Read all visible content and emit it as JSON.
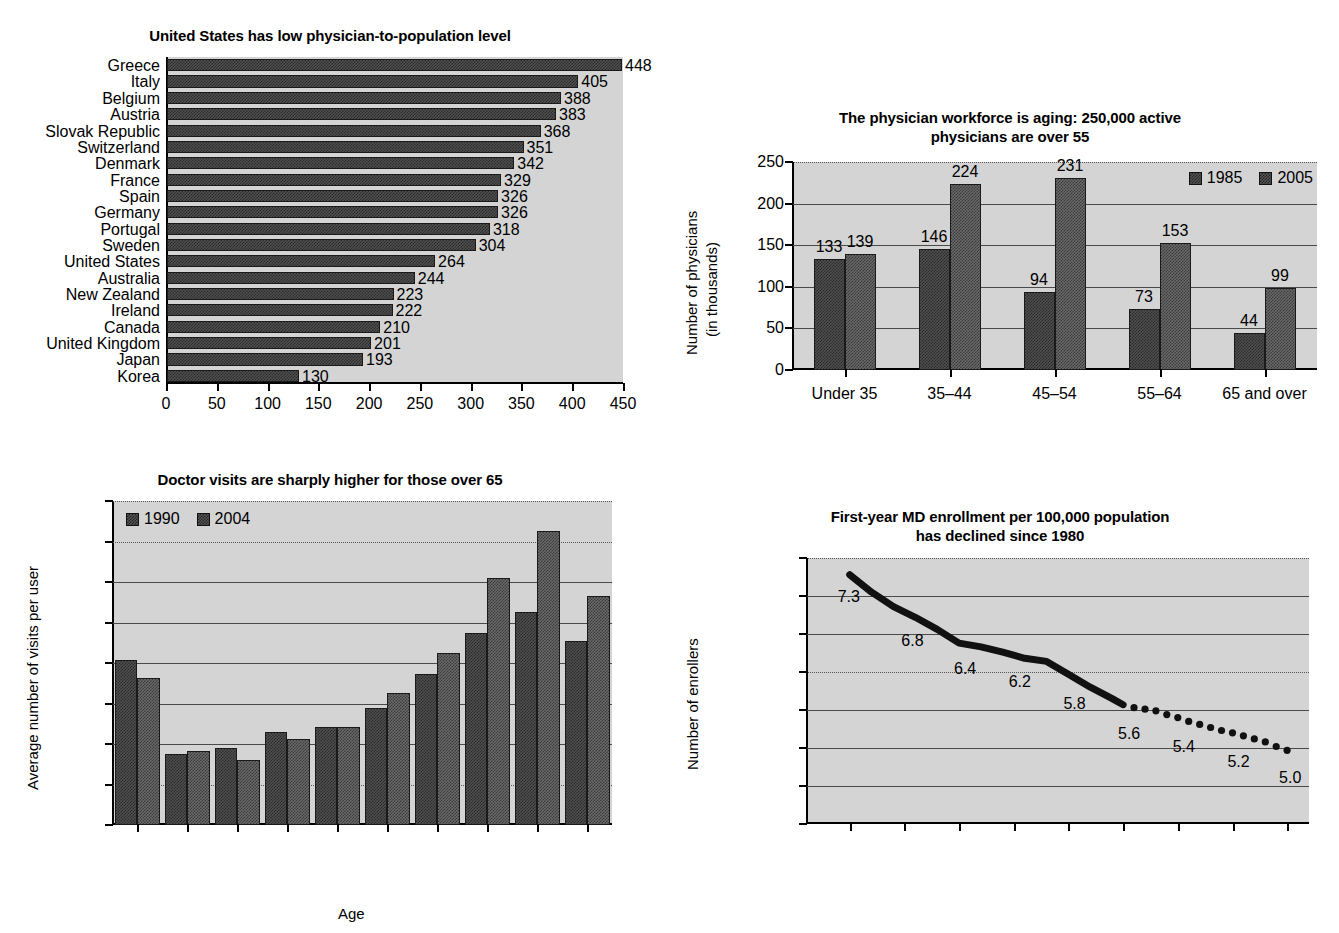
{
  "chart_data": [
    {
      "id": "physician-to-population",
      "type": "bar",
      "orientation": "horizontal",
      "title": "United States has low physician-to-population level",
      "xlabel": "",
      "ylabel": "",
      "xlim": [
        0,
        450
      ],
      "xticks": [
        0,
        50,
        100,
        150,
        200,
        250,
        300,
        350,
        400,
        450
      ],
      "grid": false,
      "legend": null,
      "categories": [
        "Greece",
        "Italy",
        "Belgium",
        "Austria",
        "Slovak Republic",
        "Switzerland",
        "Denmark",
        "France",
        "Spain",
        "Germany",
        "Portugal",
        "Sweden",
        "United States",
        "Australia",
        "New Zealand",
        "Ireland",
        "Canada",
        "United Kingdom",
        "Japan",
        "Korea"
      ],
      "values": [
        448,
        405,
        388,
        383,
        368,
        351,
        342,
        329,
        326,
        326,
        318,
        304,
        264,
        244,
        223,
        222,
        210,
        201,
        193,
        130
      ],
      "value_labels": [
        "448",
        "405",
        "388",
        "383",
        "368",
        "351",
        "342",
        "329",
        "326",
        "326",
        "318",
        "304",
        "264",
        "244",
        "223",
        "222",
        "210",
        "201",
        "193",
        "130"
      ]
    },
    {
      "id": "physician-workforce-aging",
      "type": "bar",
      "orientation": "vertical",
      "title_line1": "The physician workforce is aging: 250,000 active",
      "title_line2": "physicians are over 55",
      "title": "The physician workforce is aging: 250,000 active physicians are over 55",
      "ylabel_line1": "Number of physicians",
      "ylabel_line2": "(in thousands)",
      "xlabel": "",
      "ylim": [
        0,
        250
      ],
      "yticks": [
        0,
        50,
        100,
        150,
        200,
        250
      ],
      "ytick_labels": [
        "0",
        "50",
        "100",
        "150",
        "200",
        "250"
      ],
      "grid": true,
      "legend_position": "top-right",
      "categories": [
        "Under 35",
        "35–44",
        "45–54",
        "55–64",
        "65 and over"
      ],
      "series": [
        {
          "name": "1985",
          "values": [
            133,
            146,
            94,
            73,
            44
          ]
        },
        {
          "name": "2005",
          "values": [
            139,
            224,
            231,
            153,
            99
          ]
        }
      ]
    },
    {
      "id": "doctor-visits-by-age",
      "type": "bar",
      "orientation": "vertical",
      "title": "Doctor visits are sharply higher for those over 65",
      "ylabel": "Average number of visits per user",
      "xlabel": "Age",
      "ylim": [
        0.0,
        8.0
      ],
      "yticks": [
        0.0,
        1.0,
        2.0,
        3.0,
        4.0,
        5.0,
        6.0,
        7.0,
        8.0
      ],
      "ytick_labels": [
        "0.0",
        "1.0",
        "2.0",
        "3.0",
        "4.0",
        "5.0",
        "6.0",
        "7.0",
        "8.0"
      ],
      "grid": true,
      "legend_position": "top-left",
      "categories": [
        "<5",
        "5–14",
        "15–24",
        "25–34",
        "35–44",
        "45–54",
        "55–64",
        "65–74",
        "75–84",
        ">84"
      ],
      "series": [
        {
          "name": "1990",
          "values": [
            4.08,
            1.75,
            1.9,
            2.3,
            2.43,
            2.9,
            3.73,
            4.75,
            5.25,
            4.55
          ]
        },
        {
          "name": "2004",
          "values": [
            3.62,
            1.82,
            1.6,
            2.12,
            2.42,
            3.27,
            4.25,
            6.1,
            7.27,
            5.65
          ]
        }
      ]
    },
    {
      "id": "first-year-md-enrollment",
      "type": "line",
      "title_line1": "First-year MD enrollment per 100,000 population",
      "title_line2": "has declined since 1980",
      "title": "First-year MD enrollment per 100,000 population has declined since 1980",
      "ylabel": "Number of enrollers",
      "xlabel": "",
      "xlim": [
        1976,
        2022
      ],
      "ylim": [
        4.0,
        7.5
      ],
      "xticks": [
        1980,
        1985,
        1990,
        1995,
        2000,
        2005,
        2010,
        2015,
        2020
      ],
      "xtick_labels": [
        "1980",
        "1985",
        "1990",
        "1995",
        "2000",
        "2005",
        "2010",
        "2015",
        "2020"
      ],
      "yticks": [
        4.0,
        4.5,
        5.0,
        5.5,
        6.0,
        6.5,
        7.0,
        7.5
      ],
      "ytick_labels": [
        "4.0",
        "4.5",
        "5.0",
        "5.5",
        "6.0",
        "6.5",
        "7.0",
        "7.5"
      ],
      "grid": true,
      "legend": null,
      "solid_segment": {
        "x": [
          1980,
          1982,
          1984,
          1986,
          1988,
          1990,
          1992,
          1994,
          1996,
          1998,
          2000,
          2002,
          2004,
          2005
        ],
        "y": [
          7.28,
          7.05,
          6.86,
          6.72,
          6.56,
          6.38,
          6.33,
          6.26,
          6.18,
          6.14,
          5.97,
          5.8,
          5.65,
          5.57
        ]
      },
      "dotted_segment": {
        "x": [
          2006,
          2007,
          2008,
          2009,
          2010,
          2011,
          2012,
          2013,
          2014,
          2015,
          2016,
          2017,
          2018,
          2019,
          2020
        ],
        "y": [
          5.53,
          5.51,
          5.49,
          5.44,
          5.4,
          5.35,
          5.31,
          5.27,
          5.23,
          5.2,
          5.16,
          5.12,
          5.08,
          5.02,
          4.97
        ]
      },
      "annotations": [
        {
          "text": "7.3",
          "x": 1980,
          "y": 7.28
        },
        {
          "text": "6.8",
          "x": 1986,
          "y": 6.72
        },
        {
          "text": "6.4",
          "x": 1991,
          "y": 6.35
        },
        {
          "text": "6.2",
          "x": 1996,
          "y": 6.18
        },
        {
          "text": "5.8",
          "x": 2001,
          "y": 5.9
        },
        {
          "text": "5.6",
          "x": 2006,
          "y": 5.53
        },
        {
          "text": "5.4",
          "x": 2011,
          "y": 5.35
        },
        {
          "text": "5.2",
          "x": 2016,
          "y": 5.16
        },
        {
          "text": "5.0",
          "x": 2020,
          "y": 4.97
        }
      ]
    }
  ],
  "colors": {
    "plot_background": "#d4d4d4",
    "bar_fill": "#4f4f4f",
    "grid": "#4a4a4a",
    "axis": "#000000",
    "text": "#000000",
    "page_background": "#ffffff"
  }
}
